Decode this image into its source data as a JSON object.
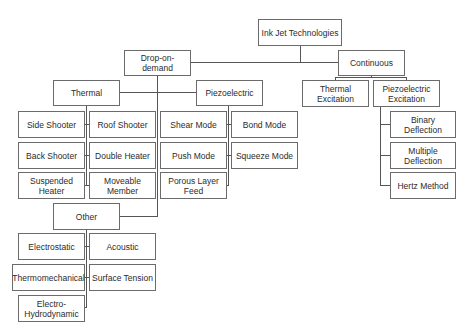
{
  "diagram": {
    "title": "Ink Jet Technologies",
    "root": "Ink Jet Technologies",
    "drop_on_demand": {
      "label": "Drop-on-demand",
      "thermal": {
        "label": "Thermal",
        "children": [
          "Side Shooter",
          "Roof Shooter",
          "Back Shooter",
          "Double Heater",
          "Suspended Heater",
          "Moveable Member"
        ]
      },
      "piezoelectric": {
        "label": "Piezoelectric",
        "children": [
          "Shear Mode",
          "Bond Mode",
          "Push Mode",
          "Squeeze Mode",
          "Porous Layer Feed"
        ]
      },
      "other": {
        "label": "Other",
        "children": [
          "Electrostatic",
          "Acoustic",
          "Thermomechanical",
          "Surface Tension",
          "Electro-Hydrodynamic"
        ]
      }
    },
    "continuous": {
      "label": "Continuous",
      "thermal_excitation": {
        "label": "Thermal Excitation"
      },
      "piezoelectric_excitation": {
        "label": "Piezoelectric Excitation",
        "children": [
          "Binary Deflection",
          "Multiple Deflection",
          "Hertz Method"
        ]
      }
    }
  },
  "colors": {
    "border": "#6b6b6b",
    "line": "#555555",
    "text": "#2b2b2b",
    "background": "#ffffff"
  }
}
